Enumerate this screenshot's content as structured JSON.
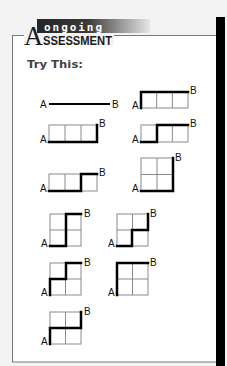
{
  "header": {
    "banner_word": "ongoing",
    "title_initial": "A",
    "title_rest": "SSESSMENT"
  },
  "section": {
    "heading": "Try This:"
  },
  "colors": {
    "page_bg": "#f3f3f3",
    "box_bg": "#ffffff",
    "box_border": "#777777",
    "side_bar": "#000000",
    "grid_line": "#8a8a8a",
    "path_line": "#000000",
    "heading": "#444444"
  },
  "labels": {
    "start": "A",
    "end": "B"
  },
  "diagrams": [
    {
      "id": "d1",
      "type": "line",
      "path": [
        [
          50,
          104
        ],
        [
          109,
          104
        ]
      ],
      "a": [
        40,
        108
      ],
      "b": [
        112,
        108
      ]
    },
    {
      "id": "d2",
      "type": "grid",
      "grid": {
        "x": 141,
        "y": 92,
        "w": 47,
        "h": 16,
        "cols": 3,
        "rows": 1
      },
      "path": [
        [
          141,
          108
        ],
        [
          141,
          92
        ],
        [
          188,
          92
        ]
      ],
      "a": [
        132,
        109
      ],
      "b": [
        190,
        94
      ]
    },
    {
      "id": "d3",
      "type": "grid",
      "grid": {
        "x": 49,
        "y": 125,
        "w": 48,
        "h": 17,
        "cols": 3,
        "rows": 1
      },
      "path": [
        [
          49,
          142
        ],
        [
          97,
          142
        ],
        [
          97,
          125
        ]
      ],
      "a": [
        40,
        143
      ],
      "b": [
        99,
        127
      ]
    },
    {
      "id": "d4",
      "type": "grid",
      "grid": {
        "x": 141,
        "y": 125,
        "w": 47,
        "h": 17,
        "cols": 3,
        "rows": 1
      },
      "path": [
        [
          141,
          142
        ],
        [
          157,
          142
        ],
        [
          157,
          125
        ],
        [
          188,
          125
        ]
      ],
      "a": [
        132,
        143
      ],
      "b": [
        190,
        127
      ]
    },
    {
      "id": "d5",
      "type": "grid",
      "grid": {
        "x": 49,
        "y": 174,
        "w": 48,
        "h": 17,
        "cols": 3,
        "rows": 1
      },
      "path": [
        [
          49,
          191
        ],
        [
          81,
          191
        ],
        [
          81,
          174
        ],
        [
          97,
          174
        ]
      ],
      "a": [
        40,
        192
      ],
      "b": [
        99,
        176
      ]
    },
    {
      "id": "d6",
      "type": "grid",
      "grid": {
        "x": 141,
        "y": 158,
        "w": 32,
        "h": 33,
        "cols": 2,
        "rows": 2
      },
      "path": [
        [
          141,
          191
        ],
        [
          173,
          191
        ],
        [
          173,
          158
        ]
      ],
      "a": [
        132,
        192
      ],
      "b": [
        175,
        161
      ]
    },
    {
      "id": "d7",
      "type": "grid",
      "grid": {
        "x": 50,
        "y": 214,
        "w": 31,
        "h": 32,
        "cols": 2,
        "rows": 2
      },
      "path": [
        [
          50,
          246
        ],
        [
          66,
          246
        ],
        [
          66,
          214
        ],
        [
          81,
          214
        ]
      ],
      "a": [
        41,
        247
      ],
      "b": [
        84,
        217
      ]
    },
    {
      "id": "d8",
      "type": "grid",
      "grid": {
        "x": 117,
        "y": 214,
        "w": 31,
        "h": 32,
        "cols": 2,
        "rows": 2
      },
      "path": [
        [
          117,
          246
        ],
        [
          132,
          246
        ],
        [
          132,
          230
        ],
        [
          148,
          230
        ],
        [
          148,
          214
        ]
      ],
      "a": [
        108,
        247
      ],
      "b": [
        150,
        217
      ]
    },
    {
      "id": "d9",
      "type": "grid",
      "grid": {
        "x": 50,
        "y": 263,
        "w": 31,
        "h": 32,
        "cols": 2,
        "rows": 2
      },
      "path": [
        [
          50,
          295
        ],
        [
          50,
          279
        ],
        [
          66,
          279
        ],
        [
          66,
          263
        ],
        [
          81,
          263
        ]
      ],
      "a": [
        41,
        296
      ],
      "b": [
        84,
        266
      ]
    },
    {
      "id": "d10",
      "type": "grid",
      "grid": {
        "x": 117,
        "y": 263,
        "w": 31,
        "h": 32,
        "cols": 2,
        "rows": 2
      },
      "path": [
        [
          117,
          295
        ],
        [
          117,
          263
        ],
        [
          148,
          263
        ]
      ],
      "a": [
        108,
        296
      ],
      "b": [
        150,
        266
      ]
    },
    {
      "id": "d11",
      "type": "grid",
      "grid": {
        "x": 50,
        "y": 312,
        "w": 31,
        "h": 32,
        "cols": 2,
        "rows": 2
      },
      "path": [
        [
          50,
          344
        ],
        [
          50,
          328
        ],
        [
          81,
          328
        ],
        [
          81,
          312
        ]
      ],
      "a": [
        41,
        345
      ],
      "b": [
        84,
        315
      ]
    }
  ]
}
